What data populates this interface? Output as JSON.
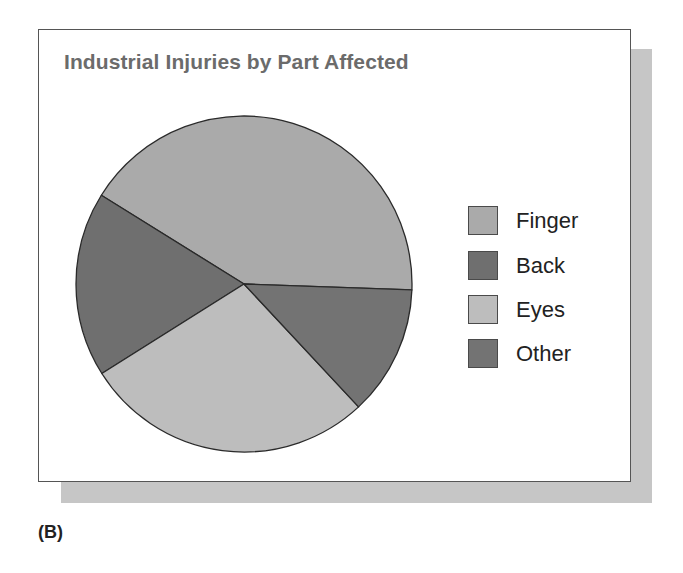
{
  "chart_data": {
    "type": "pie",
    "title": "Industrial Injuries by Part Affected",
    "categories": [
      "Finger",
      "Back",
      "Eyes",
      "Other"
    ],
    "values": [
      41.7,
      17.8,
      28.0,
      12.5
    ],
    "unit": "percent (estimated from slice angles)",
    "colors": [
      "#aaaaaa",
      "#6f6f6f",
      "#bdbdbd",
      "#737373"
    ],
    "legend_position": "right",
    "start_angle_deg": -2,
    "direction": "counterclockwise"
  },
  "figure": {
    "title": "Industrial Injuries by Part Affected",
    "panel_label": "(B)",
    "legend": [
      {
        "label": "Finger",
        "color": "#aaaaaa"
      },
      {
        "label": "Back",
        "color": "#6f6f6f"
      },
      {
        "label": "Eyes",
        "color": "#bdbdbd"
      },
      {
        "label": "Other",
        "color": "#737373"
      }
    ]
  }
}
